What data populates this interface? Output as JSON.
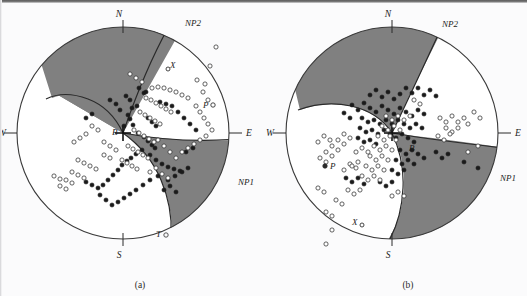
{
  "figure": {
    "type": "focal-mechanism-beachball-pair",
    "background_color": "#fbfbfc",
    "quadrant_fill_color": "#808080",
    "quadrant_empty_color": "#ffffff",
    "outline_color": "#3a3a3a",
    "marker_filled_color": "#1a1a1a",
    "marker_open_color": "#ffffff",
    "caption_a": "(a)",
    "caption_b": "(b)"
  },
  "panels": [
    {
      "id": "a",
      "caption": "(a)",
      "center_x": 123,
      "center_y": 133,
      "radius": 106,
      "compass": {
        "north": "N",
        "south": "S",
        "east": "E",
        "west": "W"
      },
      "nodal_planes": [
        {
          "label": "NP1",
          "label_x": 239,
          "label_y": 182
        },
        {
          "label": "NP2",
          "label_x": 185,
          "label_y": 24
        }
      ],
      "axes": [
        {
          "label": "P",
          "x": 204,
          "y": 104,
          "marker_x": 213,
          "marker_y": 105
        },
        {
          "label": "T",
          "x": 158,
          "y": 233,
          "marker_x": 166,
          "marker_y": 235
        },
        {
          "label": "B",
          "x": 117,
          "y": 131,
          "marker_x": 122,
          "marker_y": 133
        },
        {
          "label": "X",
          "x": 173,
          "y": 65,
          "marker_x": 168,
          "marker_y": 69
        }
      ],
      "center_marker": "cross",
      "plane1": {
        "strike_deg": 62,
        "dip_deg": 58
      },
      "plane2": {
        "strike_deg": 160,
        "dip_deg": 68
      },
      "points_filled": [
        [
          139,
          88
        ],
        [
          144,
          93
        ],
        [
          146,
          92
        ],
        [
          132,
          108
        ],
        [
          137,
          106
        ],
        [
          128,
          115
        ],
        [
          130,
          119
        ],
        [
          124,
          126
        ],
        [
          133,
          125
        ],
        [
          138,
          133
        ],
        [
          144,
          137
        ],
        [
          148,
          141
        ],
        [
          152,
          145
        ],
        [
          155,
          148
        ],
        [
          142,
          150
        ],
        [
          136,
          154
        ],
        [
          131,
          158
        ],
        [
          127,
          161
        ],
        [
          122,
          165
        ],
        [
          118,
          170
        ],
        [
          113,
          175
        ],
        [
          108,
          180
        ],
        [
          103,
          185
        ],
        [
          98,
          188
        ],
        [
          92,
          185
        ],
        [
          86,
          182
        ],
        [
          150,
          155
        ],
        [
          156,
          160
        ],
        [
          162,
          164
        ],
        [
          168,
          167
        ],
        [
          174,
          169
        ],
        [
          180,
          171
        ],
        [
          158,
          176
        ],
        [
          150,
          180
        ],
        [
          143,
          185
        ],
        [
          136,
          190
        ],
        [
          130,
          194
        ],
        [
          124,
          198
        ],
        [
          118,
          202
        ],
        [
          112,
          205
        ],
        [
          106,
          200
        ],
        [
          100,
          195
        ],
        [
          168,
          180
        ],
        [
          175,
          176
        ],
        [
          182,
          172
        ],
        [
          188,
          168
        ],
        [
          164,
          190
        ],
        [
          170,
          186
        ],
        [
          176,
          192
        ],
        [
          86,
          118
        ],
        [
          92,
          114
        ],
        [
          160,
          102
        ],
        [
          166,
          104
        ],
        [
          172,
          106
        ],
        [
          178,
          112
        ],
        [
          184,
          118
        ],
        [
          190,
          124
        ],
        [
          196,
          130
        ],
        [
          148,
          118
        ],
        [
          152,
          122
        ],
        [
          156,
          126
        ],
        [
          126,
          96
        ],
        [
          130,
          100
        ],
        [
          120,
          110
        ],
        [
          116,
          104
        ],
        [
          110,
          100
        ],
        [
          193,
          148
        ],
        [
          186,
          152
        ]
      ],
      "points_open": [
        [
          152,
          88
        ],
        [
          158,
          87
        ],
        [
          164,
          88
        ],
        [
          170,
          90
        ],
        [
          176,
          92
        ],
        [
          182,
          95
        ],
        [
          188,
          98
        ],
        [
          146,
          98
        ],
        [
          151,
          100
        ],
        [
          156,
          103
        ],
        [
          161,
          106
        ],
        [
          166,
          109
        ],
        [
          171,
          112
        ],
        [
          140,
          112
        ],
        [
          145,
          115
        ],
        [
          150,
          118
        ],
        [
          155,
          121
        ],
        [
          160,
          124
        ],
        [
          134,
          130
        ],
        [
          139,
          133
        ],
        [
          144,
          136
        ],
        [
          149,
          139
        ],
        [
          154,
          142
        ],
        [
          128,
          146
        ],
        [
          133,
          149
        ],
        [
          138,
          152
        ],
        [
          143,
          155
        ],
        [
          148,
          158
        ],
        [
          122,
          160
        ],
        [
          127,
          163
        ],
        [
          132,
          166
        ],
        [
          137,
          169
        ],
        [
          197,
          80
        ],
        [
          203,
          92
        ],
        [
          208,
          100
        ],
        [
          196,
          106
        ],
        [
          200,
          112
        ],
        [
          204,
          118
        ],
        [
          208,
          124
        ],
        [
          212,
          130
        ],
        [
          206,
          136
        ],
        [
          200,
          140
        ],
        [
          194,
          144
        ],
        [
          188,
          148
        ],
        [
          182,
          152
        ],
        [
          78,
          160
        ],
        [
          84,
          163
        ],
        [
          90,
          166
        ],
        [
          96,
          169
        ],
        [
          72,
          172
        ],
        [
          78,
          175
        ],
        [
          84,
          178
        ],
        [
          66,
          180
        ],
        [
          72,
          183
        ],
        [
          60,
          186
        ],
        [
          66,
          189
        ],
        [
          54,
          176
        ],
        [
          60,
          179
        ],
        [
          104,
          155
        ],
        [
          110,
          158
        ],
        [
          116,
          150
        ],
        [
          110,
          146
        ],
        [
          104,
          142
        ],
        [
          98,
          130
        ],
        [
          92,
          126
        ],
        [
          86,
          134
        ],
        [
          80,
          138
        ],
        [
          74,
          142
        ],
        [
          216,
          47
        ],
        [
          210,
          66
        ],
        [
          205,
          84
        ],
        [
          158,
          140
        ],
        [
          164,
          146
        ],
        [
          170,
          152
        ],
        [
          176,
          158
        ],
        [
          130,
          74
        ],
        [
          136,
          78
        ],
        [
          142,
          82
        ],
        [
          150,
          172
        ],
        [
          156,
          168
        ],
        [
          162,
          174
        ],
        [
          168,
          178
        ]
      ]
    },
    {
      "id": "b",
      "caption": "(b)",
      "center_x": 392,
      "center_y": 133,
      "radius": 106,
      "compass": {
        "north": "N",
        "south": "S",
        "east": "E",
        "west": "W"
      },
      "nodal_planes": [
        {
          "label": "NP1",
          "label_x": 502,
          "label_y": 178
        },
        {
          "label": "NP2",
          "label_x": 442,
          "label_y": 25
        }
      ],
      "axes": [
        {
          "label": "P",
          "x": 330,
          "y": 165,
          "marker_x": 325,
          "marker_y": 166
        },
        {
          "label": "X",
          "x": 358,
          "y": 222,
          "marker_x": 362,
          "marker_y": 225
        },
        {
          "label": "B",
          "x": 412,
          "y": 148,
          "marker_x": 410,
          "marker_y": 145
        }
      ],
      "center_marker": "cross",
      "plane1": {
        "strike_deg": 55,
        "dip_deg": 62
      },
      "plane2": {
        "strike_deg": 148,
        "dip_deg": 60
      },
      "points_filled": [
        [
          370,
          95
        ],
        [
          376,
          90
        ],
        [
          382,
          97
        ],
        [
          388,
          92
        ],
        [
          394,
          99
        ],
        [
          400,
          94
        ],
        [
          406,
          88
        ],
        [
          412,
          93
        ],
        [
          418,
          88
        ],
        [
          424,
          95
        ],
        [
          430,
          90
        ],
        [
          436,
          96
        ],
        [
          352,
          105
        ],
        [
          358,
          110
        ],
        [
          364,
          103
        ],
        [
          370,
          108
        ],
        [
          376,
          112
        ],
        [
          382,
          106
        ],
        [
          388,
          110
        ],
        [
          394,
          114
        ],
        [
          400,
          108
        ],
        [
          406,
          112
        ],
        [
          412,
          116
        ],
        [
          418,
          110
        ],
        [
          424,
          114
        ],
        [
          344,
          113
        ],
        [
          350,
          118
        ],
        [
          362,
          118
        ],
        [
          368,
          122
        ],
        [
          374,
          120
        ],
        [
          380,
          124
        ],
        [
          386,
          120
        ],
        [
          392,
          124
        ],
        [
          398,
          120
        ],
        [
          404,
          124
        ],
        [
          410,
          128
        ],
        [
          416,
          124
        ],
        [
          422,
          128
        ],
        [
          360,
          128
        ],
        [
          366,
          132
        ],
        [
          372,
          130
        ],
        [
          378,
          134
        ],
        [
          384,
          130
        ],
        [
          390,
          134
        ],
        [
          396,
          138
        ],
        [
          402,
          134
        ],
        [
          408,
          138
        ],
        [
          414,
          142
        ],
        [
          358,
          138
        ],
        [
          364,
          142
        ],
        [
          370,
          140
        ],
        [
          376,
          144
        ],
        [
          400,
          150
        ],
        [
          406,
          154
        ],
        [
          412,
          150
        ],
        [
          418,
          154
        ],
        [
          424,
          158
        ],
        [
          396,
          160
        ],
        [
          402,
          164
        ],
        [
          408,
          160
        ],
        [
          414,
          164
        ],
        [
          392,
          170
        ],
        [
          398,
          174
        ],
        [
          404,
          170
        ],
        [
          380,
          182
        ],
        [
          386,
          186
        ],
        [
          392,
          182
        ],
        [
          346,
          178
        ],
        [
          352,
          182
        ],
        [
          358,
          178
        ],
        [
          364,
          184
        ],
        [
          436,
          152
        ],
        [
          442,
          158
        ],
        [
          448,
          154
        ],
        [
          478,
          168
        ],
        [
          464,
          162
        ]
      ],
      "points_open": [
        [
          386,
          116
        ],
        [
          392,
          120
        ],
        [
          398,
          116
        ],
        [
          404,
          120
        ],
        [
          410,
          116
        ],
        [
          382,
          126
        ],
        [
          388,
          130
        ],
        [
          394,
          126
        ],
        [
          400,
          130
        ],
        [
          378,
          136
        ],
        [
          384,
          140
        ],
        [
          390,
          136
        ],
        [
          396,
          140
        ],
        [
          374,
          146
        ],
        [
          380,
          150
        ],
        [
          386,
          146
        ],
        [
          392,
          150
        ],
        [
          370,
          156
        ],
        [
          376,
          160
        ],
        [
          382,
          156
        ],
        [
          388,
          160
        ],
        [
          366,
          166
        ],
        [
          372,
          170
        ],
        [
          378,
          166
        ],
        [
          384,
          170
        ],
        [
          362,
          176
        ],
        [
          368,
          180
        ],
        [
          374,
          176
        ],
        [
          380,
          180
        ],
        [
          344,
          134
        ],
        [
          350,
          138
        ],
        [
          338,
          140
        ],
        [
          344,
          144
        ],
        [
          332,
          146
        ],
        [
          338,
          150
        ],
        [
          326,
          152
        ],
        [
          332,
          156
        ],
        [
          320,
          158
        ],
        [
          326,
          162
        ],
        [
          324,
          136
        ],
        [
          330,
          140
        ],
        [
          318,
          142
        ],
        [
          440,
          118
        ],
        [
          446,
          122
        ],
        [
          452,
          116
        ],
        [
          458,
          122
        ],
        [
          464,
          118
        ],
        [
          446,
          128
        ],
        [
          452,
          132
        ],
        [
          458,
          128
        ],
        [
          438,
          136
        ],
        [
          444,
          140
        ],
        [
          450,
          134
        ],
        [
          474,
          112
        ],
        [
          480,
          118
        ],
        [
          468,
          124
        ],
        [
          478,
          146
        ],
        [
          468,
          152
        ],
        [
          356,
          152
        ],
        [
          362,
          148
        ],
        [
          368,
          152
        ],
        [
          350,
          164
        ],
        [
          356,
          168
        ],
        [
          344,
          170
        ],
        [
          348,
          190
        ],
        [
          354,
          194
        ],
        [
          360,
          190
        ],
        [
          336,
          200
        ],
        [
          342,
          204
        ],
        [
          326,
          212
        ],
        [
          332,
          216
        ],
        [
          318,
          188
        ],
        [
          324,
          192
        ],
        [
          332,
          230
        ],
        [
          326,
          244
        ],
        [
          352,
          166
        ],
        [
          358,
          162
        ],
        [
          392,
          196
        ],
        [
          398,
          192
        ],
        [
          404,
          196
        ],
        [
          414,
          100
        ],
        [
          420,
          104
        ]
      ]
    }
  ]
}
